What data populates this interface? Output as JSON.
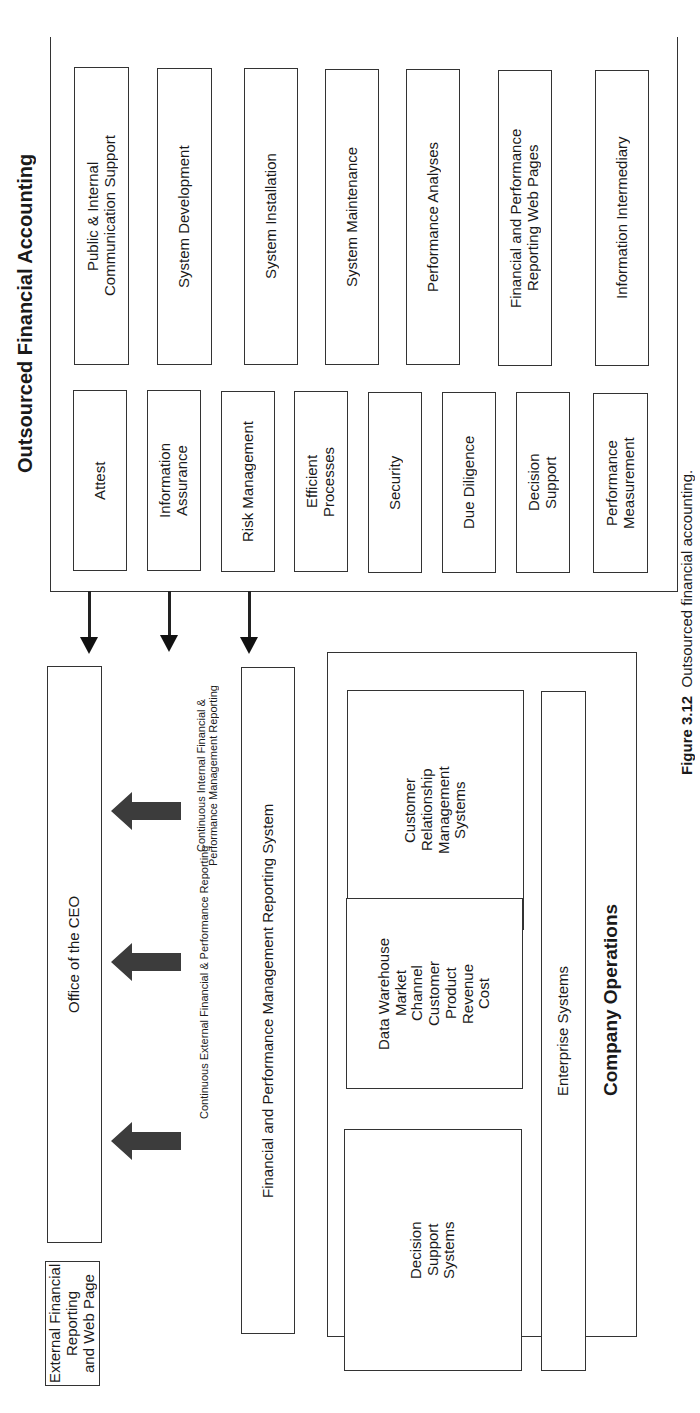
{
  "outsourced_financial_accounting": {
    "title": "Outsourced Financial Accounting",
    "upper_column": [
      "Public & Internal\nCommunication Support",
      "System Development",
      "System Installation",
      "System Maintenance",
      "Performance Analyses",
      "Financial and Performance\nReporting Web Pages",
      "Information Intermediary"
    ],
    "lower_column": [
      "Attest",
      "Information\nAssurance",
      "Risk Management",
      "Efficient\nProcesses",
      "Security",
      "Due Diligence",
      "Decision\nSupport",
      "Performance\nMeasurement"
    ]
  },
  "office_of_ceo": "Office of the CEO",
  "external_reporting": "External Financial Reporting\nand Web  Page",
  "fpm_reporting_system": "Financial and Performance Management Reporting System",
  "flows": {
    "internal_label": "Continuous Internal Financial &\nPerformance Management Reporting",
    "external_label": "Continuous External Financial & Performance Reporting"
  },
  "company_operations": {
    "title": "Company Operations",
    "crm": "Customer\nRelationship\nManagement\nSystems",
    "data_warehouse": "Data Warehouse\nMarket\nChannel\nCustomer\nProduct\nRevenue\nCost",
    "decision_support": "Decision\nSupport\nSystems",
    "enterprise_systems": "Enterprise Systems"
  },
  "caption": {
    "figure_number": "Figure 3.12",
    "text": "Outsourced financial accounting."
  }
}
